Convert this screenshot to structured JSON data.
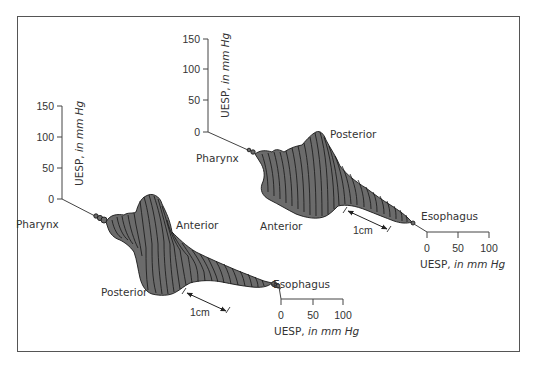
{
  "figure": {
    "colors": {
      "fill": "#6b6b6b",
      "outline": "#1a1a1a",
      "axis": "#444444",
      "frame": "#555555"
    }
  },
  "left_plot": {
    "vertical_axis": {
      "label_main": "UESP, ",
      "label_italic": "in mm Hg",
      "ticks": [
        "150",
        "100",
        "50",
        "0"
      ]
    },
    "horizontal_axis": {
      "label_main": "UESP, ",
      "label_italic": "in mm Hg",
      "ticks": [
        "0",
        "50",
        "100"
      ]
    },
    "labels": {
      "proximal": "Pharynx",
      "distal": "Esophagus",
      "top": "Anterior",
      "bottom": "Posterior"
    },
    "scale_bar": "1cm"
  },
  "right_plot": {
    "vertical_axis": {
      "label_main": "UESP, ",
      "label_italic": "in mm Hg",
      "ticks": [
        "150",
        "100",
        "50",
        "0"
      ]
    },
    "horizontal_axis": {
      "label_main": "UESP, ",
      "label_italic": "in mm Hg",
      "ticks": [
        "0",
        "50",
        "100"
      ]
    },
    "labels": {
      "proximal": "Pharynx",
      "distal": "Esophagus",
      "top": "Posterior",
      "bottom": "Anterior"
    },
    "scale_bar": "1cm"
  }
}
